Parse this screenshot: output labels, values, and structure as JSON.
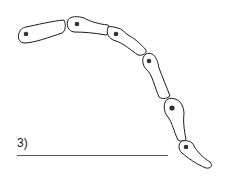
{
  "figure": {
    "label": "3)",
    "cell_count": 6,
    "stroke_color": "#1a1a1a",
    "nucleus_color": "#333333",
    "line_color": "#555555"
  }
}
